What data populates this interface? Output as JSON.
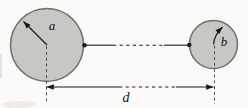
{
  "figure": {
    "labels": {
      "large_circle_radius": "a",
      "small_circle_radius": "b",
      "center_distance": "d"
    },
    "colors": {
      "background": "#fbfaf8",
      "circle_fill": "#c8c7c4",
      "circle_stroke": "#6f6f6d",
      "line": "#1b1b1b"
    }
  }
}
